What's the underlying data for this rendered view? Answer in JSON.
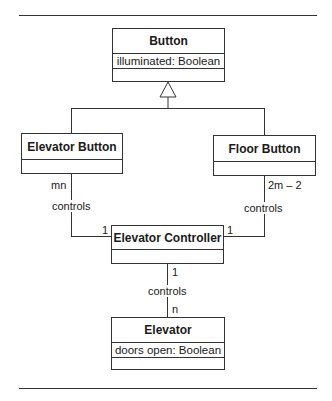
{
  "classes": {
    "button": {
      "name": "Button",
      "attribute": "illuminated: Boolean"
    },
    "elevator_button": {
      "name": "Elevator Button"
    },
    "floor_button": {
      "name": "Floor Button"
    },
    "elevator_controller": {
      "name": "Elevator Controller"
    },
    "elevator": {
      "name": "Elevator",
      "attribute": "doors open: Boolean"
    }
  },
  "associations": {
    "elevator_button_controller": {
      "label": "controls",
      "mult_button": "mn",
      "mult_controller": "1"
    },
    "floor_button_controller": {
      "label": "controls",
      "mult_button": "2m – 2",
      "mult_controller": "1"
    },
    "controller_elevator": {
      "label": "controls",
      "mult_controller": "1",
      "mult_elevator": "n"
    }
  }
}
